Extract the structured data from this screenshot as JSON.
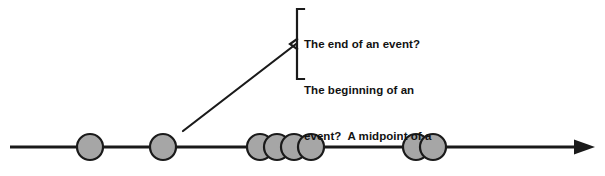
{
  "diagram": {
    "type": "timeline-with-annotation",
    "title": "",
    "background_color": "#ffffff",
    "timeline": {
      "name": "event-timeline-axis",
      "stroke_color": "#1a1a1a",
      "stroke_width": 3,
      "y": 147,
      "x_start": 10,
      "x_end": 595,
      "arrowhead": {
        "position": "right-end",
        "style": "solid-triangle"
      }
    },
    "markers": {
      "fill_color": "#a6a6a6",
      "stroke_color": "#1a1a1a",
      "stroke_width": 2.2,
      "radius": 13,
      "groups": [
        {
          "label": "single-event-1",
          "count": 1,
          "centers_x": [
            90
          ]
        },
        {
          "label": "single-event-2",
          "count": 1,
          "centers_x": [
            163
          ]
        },
        {
          "label": "event-cluster-of-four",
          "count": 4,
          "centers_x": [
            260,
            277,
            294,
            311
          ]
        },
        {
          "label": "event-pair",
          "count": 2,
          "centers_x": [
            416,
            433
          ]
        }
      ],
      "total_count": 8
    },
    "leader_line": {
      "name": "annotation-leader-line",
      "stroke_color": "#1a1a1a",
      "stroke_width": 2.2,
      "from_x": 183,
      "from_y": 131,
      "to_x": 296,
      "to_y": 44
    },
    "bracket": {
      "name": "annotation-bracket",
      "stroke_color": "#1a1a1a",
      "stroke_width": 2.2,
      "x": 297,
      "y_top": 8,
      "y_bottom": 78,
      "arm_width": 7,
      "nub_x": 290,
      "nub_y": 44
    },
    "annotation": {
      "name": "event-question-callout",
      "text_color": "#121212",
      "lines": [
        "The end of an event?",
        "The beginning of an",
        "event?  A midpoint of a",
        "series?  A one-off?"
      ],
      "full_text": "The end of an event? The beginning of an event?  A midpoint of a series?  A one-off?"
    }
  }
}
